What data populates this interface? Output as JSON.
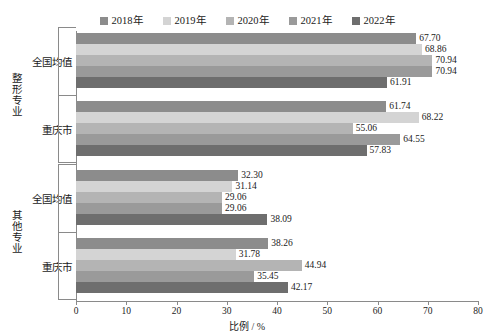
{
  "chart_data": {
    "type": "bar",
    "orientation": "horizontal",
    "title": "",
    "xlabel": "比例 / %",
    "ylabel": "",
    "xlim": [
      0,
      80
    ],
    "xticks": [
      0,
      10,
      20,
      30,
      40,
      50,
      60,
      70,
      80
    ],
    "grid": false,
    "legend_position": "top-center",
    "group_axis_labels": [
      "整形专业",
      "其他专业"
    ],
    "categories": [
      "全国均值",
      "重庆市",
      "全国均值",
      "重庆市"
    ],
    "groups": [
      {
        "group_label": "整形专业",
        "rows": [
          {
            "category": "全国均值",
            "values": [
              67.7,
              68.86,
              70.94,
              70.94,
              61.91
            ]
          },
          {
            "category": "重庆市",
            "values": [
              61.74,
              68.22,
              55.06,
              64.55,
              57.83
            ]
          }
        ]
      },
      {
        "group_label": "其他专业",
        "rows": [
          {
            "category": "全国均值",
            "values": [
              32.3,
              31.14,
              29.06,
              29.06,
              38.09
            ]
          },
          {
            "category": "重庆市",
            "values": [
              38.26,
              31.78,
              44.94,
              35.45,
              42.17
            ]
          }
        ]
      }
    ],
    "series": [
      {
        "name": "2018年",
        "color": "#8c8c8c",
        "values": [
          67.7,
          61.74,
          32.3,
          38.26
        ]
      },
      {
        "name": "2019年",
        "color": "#d4d4d4",
        "values": [
          68.86,
          68.22,
          31.14,
          31.78
        ]
      },
      {
        "name": "2020年",
        "color": "#b4b4b4",
        "values": [
          70.94,
          55.06,
          29.06,
          44.94
        ]
      },
      {
        "name": "2021年",
        "color": "#9a9a9a",
        "values": [
          70.94,
          64.55,
          29.06,
          35.45
        ]
      },
      {
        "name": "2022年",
        "color": "#6e6e6e",
        "values": [
          61.91,
          57.83,
          38.09,
          42.17
        ]
      }
    ],
    "value_labels": [
      "67.70",
      "68.86",
      "70.94",
      "70.94",
      "61.91",
      "61.74",
      "68.22",
      "55.06",
      "64.55",
      "57.83",
      "32.30",
      "31.14",
      "29.06",
      "29.06",
      "38.09",
      "38.26",
      "31.78",
      "44.94",
      "35.45",
      "42.17"
    ]
  },
  "legend": {
    "items": [
      {
        "label": "2018年",
        "color": "#8c8c8c"
      },
      {
        "label": "2019年",
        "color": "#d4d4d4"
      },
      {
        "label": "2020年",
        "color": "#b4b4b4"
      },
      {
        "label": "2021年",
        "color": "#9a9a9a"
      },
      {
        "label": "2022年",
        "color": "#6e6e6e"
      }
    ]
  },
  "axis": {
    "x_label": "比例 / %",
    "x_tick_labels": [
      "0",
      "10",
      "20",
      "30",
      "40",
      "50",
      "60",
      "70",
      "80"
    ]
  }
}
